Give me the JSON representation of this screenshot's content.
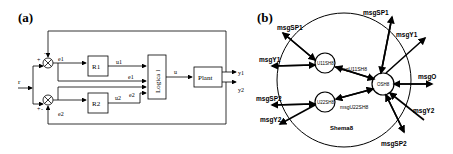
{
  "panel_a": {
    "label": "(a)",
    "input": "r",
    "blocks": {
      "r1": "R1",
      "r2": "R2",
      "logic": "Logica l",
      "plant": "Plant"
    },
    "signals": {
      "e1": "e1",
      "e2": "e2",
      "u1": "u1",
      "u2": "u2",
      "u": "u",
      "y1": "y1",
      "y2": "y2"
    },
    "signs": {
      "top_plus": "+",
      "top_minus": "-",
      "bot_plus": "+",
      "bot_minus": "-"
    }
  },
  "panel_b": {
    "label": "(b)",
    "schema": "Shema8",
    "nodes": {
      "u11": "U11SH8",
      "u22": "U22SH8",
      "o": "OSH8"
    },
    "edges": {
      "msgU11": "msgU11SH8",
      "msgU22": "msgU22SH8"
    },
    "messages": {
      "sp1_left": "msgSP1",
      "y1_left": "msgY1",
      "sp2_left": "msgSP2",
      "y2_left": "msgY2",
      "sp1_right": "msgSP1",
      "y1_right": "msgY1",
      "o": "msgO",
      "y2_right": "msgY2",
      "sp2_right": "msgSP2"
    }
  }
}
